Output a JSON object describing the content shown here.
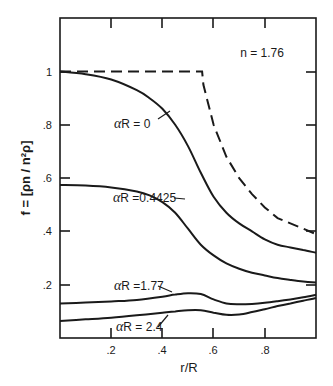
{
  "chart_data": {
    "type": "line",
    "title": "",
    "annotation_param": "n = 1.76",
    "xlabel": "r/R",
    "ylabel": "f = [ρn / n²ρ]",
    "xlim": [
      0,
      1.0
    ],
    "ylim": [
      0,
      1.2
    ],
    "x_ticks": [
      ".2",
      ".4",
      ".6",
      ".8"
    ],
    "y_ticks": [
      ".2",
      ".4",
      ".6",
      ".8",
      "1"
    ],
    "grid": false,
    "legend": "inline labels",
    "series": [
      {
        "name": "dashed (step)",
        "style": "dashed",
        "x": [
          0.0,
          0.1,
          0.2,
          0.3,
          0.4,
          0.5,
          0.555,
          0.56,
          0.6,
          0.65,
          0.7,
          0.75,
          0.8,
          0.85,
          0.9,
          0.95,
          1.0
        ],
        "y": [
          1.0,
          1.0,
          1.0,
          1.0,
          1.0,
          1.0,
          1.0,
          0.95,
          0.8,
          0.68,
          0.6,
          0.54,
          0.49,
          0.45,
          0.43,
          0.41,
          0.39
        ]
      },
      {
        "name": "αR = 0",
        "style": "solid",
        "x": [
          0.0,
          0.1,
          0.2,
          0.3,
          0.35,
          0.4,
          0.45,
          0.5,
          0.55,
          0.6,
          0.65,
          0.7,
          0.75,
          0.8,
          0.85,
          0.9,
          0.95,
          1.0
        ],
        "y": [
          1.0,
          0.99,
          0.97,
          0.93,
          0.9,
          0.86,
          0.8,
          0.72,
          0.62,
          0.53,
          0.47,
          0.43,
          0.4,
          0.37,
          0.35,
          0.34,
          0.33,
          0.32
        ]
      },
      {
        "name": "αR = 0.4425",
        "style": "solid",
        "x": [
          0.0,
          0.1,
          0.2,
          0.3,
          0.35,
          0.4,
          0.45,
          0.5,
          0.55,
          0.6,
          0.65,
          0.7,
          0.75,
          0.8,
          0.85,
          0.9,
          0.95,
          1.0
        ],
        "y": [
          0.574,
          0.572,
          0.565,
          0.55,
          0.535,
          0.51,
          0.47,
          0.41,
          0.35,
          0.31,
          0.28,
          0.26,
          0.245,
          0.235,
          0.225,
          0.218,
          0.212,
          0.208
        ]
      },
      {
        "name": "αR = 1.77",
        "style": "solid",
        "x": [
          0.0,
          0.1,
          0.2,
          0.3,
          0.4,
          0.45,
          0.5,
          0.55,
          0.6,
          0.65,
          0.7,
          0.75,
          0.8,
          0.85,
          0.9,
          0.95,
          1.0
        ],
        "y": [
          0.13,
          0.133,
          0.137,
          0.143,
          0.155,
          0.163,
          0.168,
          0.165,
          0.145,
          0.13,
          0.127,
          0.128,
          0.132,
          0.138,
          0.145,
          0.153,
          0.162
        ]
      },
      {
        "name": "αR = 2.4",
        "style": "solid",
        "x": [
          0.0,
          0.1,
          0.2,
          0.3,
          0.4,
          0.45,
          0.5,
          0.55,
          0.6,
          0.65,
          0.7,
          0.75,
          0.8,
          0.85,
          0.9,
          0.95,
          1.0
        ],
        "y": [
          0.064,
          0.07,
          0.076,
          0.085,
          0.095,
          0.1,
          0.104,
          0.104,
          0.095,
          0.087,
          0.088,
          0.097,
          0.108,
          0.12,
          0.13,
          0.14,
          0.15
        ]
      }
    ],
    "labels": {
      "n": "n = 1.76",
      "ar0": "αR = 0",
      "ar04425": "αR =0.4425",
      "ar177": "αR =1.77",
      "ar24": "αR = 2.4"
    }
  }
}
